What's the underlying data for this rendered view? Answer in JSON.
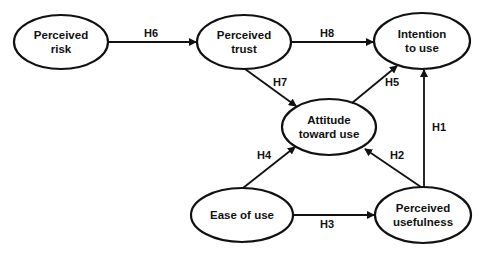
{
  "diagram": {
    "type": "structural model",
    "nodes": [
      {
        "id": "risk",
        "label": "Perceived\nrisk"
      },
      {
        "id": "trust",
        "label": "Perceived\ntrust"
      },
      {
        "id": "intention",
        "label": "Intention\nto use"
      },
      {
        "id": "attitude",
        "label": "Attitude\ntoward use"
      },
      {
        "id": "ease",
        "label": "Ease of use"
      },
      {
        "id": "usefulness",
        "label": "Perceived\nusefulness"
      }
    ],
    "edges": [
      {
        "from": "usefulness",
        "to": "intention",
        "label": "H1"
      },
      {
        "from": "usefulness",
        "to": "attitude",
        "label": "H2"
      },
      {
        "from": "ease",
        "to": "usefulness",
        "label": "H3"
      },
      {
        "from": "ease",
        "to": "attitude",
        "label": "H4"
      },
      {
        "from": "attitude",
        "to": "intention",
        "label": "H5"
      },
      {
        "from": "risk",
        "to": "trust",
        "label": "H6"
      },
      {
        "from": "trust",
        "to": "attitude",
        "label": "H7"
      },
      {
        "from": "trust",
        "to": "intention",
        "label": "H8"
      }
    ]
  }
}
